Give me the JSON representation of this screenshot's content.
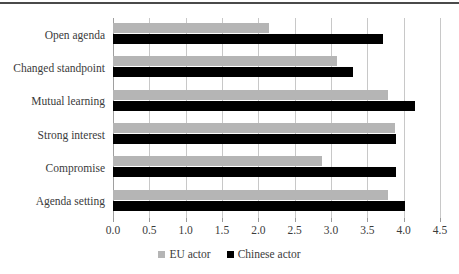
{
  "chart_data": {
    "type": "bar",
    "orientation": "horizontal",
    "title": "",
    "subtitle": "",
    "xlabel": "",
    "ylabel": "",
    "xlim": [
      0.0,
      4.5
    ],
    "xticks": [
      "0.0",
      "0.5",
      "1.0",
      "1.5",
      "2.0",
      "2.5",
      "3.0",
      "3.5",
      "4.0",
      "4.5"
    ],
    "xtick_values": [
      0.0,
      0.5,
      1.0,
      1.5,
      2.0,
      2.5,
      3.0,
      3.5,
      4.0,
      4.5
    ],
    "grid": "vertical",
    "legend_position": "bottom-center",
    "categories": [
      "Open agenda",
      "Changed standpoint",
      "Mutual learning",
      "Strong interest",
      "Compromise",
      "Agenda setting"
    ],
    "series": [
      {
        "name": "EU actor",
        "color": "#b5b5b5",
        "values": [
          2.15,
          3.08,
          3.78,
          3.88,
          2.88,
          3.78
        ]
      },
      {
        "name": "Chinese actor",
        "color": "#000000",
        "values": [
          3.72,
          3.3,
          4.15,
          3.9,
          3.9,
          4.02
        ]
      }
    ]
  },
  "legend": {
    "items": [
      {
        "label": "EU actor",
        "color": "#b5b5b5",
        "swatch_icon": "square-swatch-gray"
      },
      {
        "label": "Chinese actor",
        "color": "#000000",
        "swatch_icon": "square-swatch-black"
      }
    ]
  },
  "colors": {
    "eu_actor": "#b5b5b5",
    "chinese_actor": "#000000",
    "gridline": "#c8c8c8",
    "axis": "#a0a0a0",
    "text": "#3b3b3b",
    "top_rule": "#4a4a4a",
    "background": "#ffffff"
  }
}
